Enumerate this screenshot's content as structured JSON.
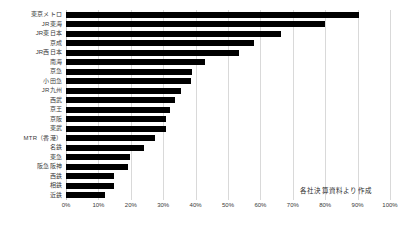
{
  "chart_data": {
    "type": "bar",
    "orientation": "horizontal",
    "title": "",
    "subtitle": "",
    "xlabel": "",
    "ylabel": "",
    "xlim": [
      0,
      100
    ],
    "xtick_labels": [
      "0%",
      "10%",
      "20%",
      "30%",
      "40%",
      "50%",
      "60%",
      "70%",
      "80%",
      "90%",
      "100%"
    ],
    "xtick_values": [
      0,
      10,
      20,
      30,
      40,
      50,
      60,
      70,
      80,
      90,
      100
    ],
    "grid": "vertical",
    "legend": "none",
    "unit": "%",
    "bar_color": "#000000",
    "categories": [
      "東京メトロ",
      "JR東海",
      "JR東日本",
      "京成",
      "JR西日本",
      "南海",
      "京急",
      "小田急",
      "JR九州",
      "西武",
      "京王",
      "京阪",
      "東武",
      "MTR（香港）",
      "名鉄",
      "東急",
      "阪急阪神",
      "西鉄",
      "相鉄",
      "近鉄"
    ],
    "values": [
      90.5,
      80.0,
      66.5,
      58.0,
      53.5,
      43.0,
      39.0,
      38.5,
      35.5,
      33.5,
      32.0,
      31.0,
      30.8,
      27.5,
      24.0,
      19.8,
      19.2,
      14.8,
      14.7,
      12.0
    ],
    "annotations": [
      {
        "name": "source-note",
        "text": "各社決算資料より作成"
      }
    ]
  }
}
